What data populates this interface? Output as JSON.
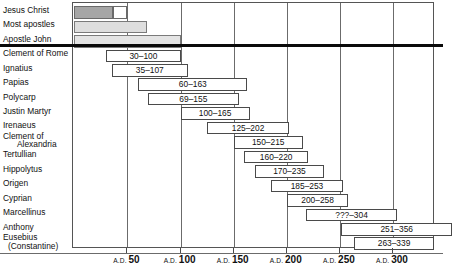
{
  "chart_data": {
    "type": "bar",
    "title": "",
    "subtitle": "",
    "xlabel": "",
    "ylabel": "",
    "orientation": "horizontal",
    "bar_style": "gantt-range",
    "xlim": [
      0,
      340
    ],
    "xticks": [
      50,
      100,
      150,
      200,
      250,
      300
    ],
    "xtick_labels": [
      "A.D. 50",
      "A.D. 100",
      "A.D. 150",
      "A.D. 200",
      "A.D. 250",
      "A.D. 300"
    ],
    "xtick_prefix": "A.D.",
    "grid": true,
    "grid_axis": "x",
    "legend": "none",
    "categories": [
      "Jesus Christ",
      "Most apostles",
      "Apostle John",
      "Clement of Rome",
      "Ignatius",
      "Papias",
      "Polycarp",
      "Justin Martyr",
      "Irenaeus",
      "Clement of Alexandria",
      "Tertullian",
      "Hippolytus",
      "Origen",
      "Cyprian",
      "Marcellinus",
      "Anthony",
      "Eusebius (Constantine)"
    ],
    "series": [
      {
        "name": "Lifespan / ministry range",
        "bars": [
          {
            "category": "Jesus Christ",
            "start": 0,
            "end": 50,
            "label": "",
            "shade": "dark",
            "segments": [
              {
                "start": 0,
                "end": 36
              },
              {
                "start": 36,
                "end": 50
              }
            ]
          },
          {
            "category": "Most apostles",
            "start": 0,
            "end": 68,
            "label": "",
            "shade": "light"
          },
          {
            "category": "Apostle John",
            "start": 0,
            "end": 100,
            "label": "",
            "shade": "lighter"
          },
          {
            "category": "Clement of Rome",
            "start": 30,
            "end": 100,
            "label": "30–100",
            "shade": "none"
          },
          {
            "category": "Ignatius",
            "start": 35,
            "end": 107,
            "label": "35–107",
            "shade": "none"
          },
          {
            "category": "Papias",
            "start": 60,
            "end": 163,
            "label": "60–163",
            "shade": "none"
          },
          {
            "category": "Polycarp",
            "start": 69,
            "end": 155,
            "label": "69–155",
            "shade": "none"
          },
          {
            "category": "Justin Martyr",
            "start": 100,
            "end": 165,
            "label": "100–165",
            "shade": "none"
          },
          {
            "category": "Irenaeus",
            "start": 125,
            "end": 202,
            "label": "125–202",
            "shade": "none"
          },
          {
            "category": "Clement of Alexandria",
            "start": 150,
            "end": 215,
            "label": "150–215",
            "shade": "none"
          },
          {
            "category": "Tertullian",
            "start": 160,
            "end": 220,
            "label": "160–220",
            "shade": "none"
          },
          {
            "category": "Hippolytus",
            "start": 170,
            "end": 235,
            "label": "170–235",
            "shade": "none"
          },
          {
            "category": "Origen",
            "start": 185,
            "end": 253,
            "label": "185–253",
            "shade": "none"
          },
          {
            "category": "Cyprian",
            "start": 200,
            "end": 258,
            "label": "200–258",
            "shade": "none"
          },
          {
            "category": "Marcellinus",
            "start": 218,
            "end": 304,
            "label": "???–304",
            "shade": "none"
          },
          {
            "category": "Anthony",
            "start": 251,
            "end": 356,
            "label": "251–356",
            "shade": "none"
          },
          {
            "category": "Eusebius (Constantine)",
            "start": 263,
            "end": 339,
            "label": "263–339",
            "shade": "none"
          }
        ]
      }
    ],
    "annotations": [
      {
        "type": "thick-rule",
        "after_category": "Apostle John",
        "note": "heavy black divider separating apostolic era from later fathers"
      }
    ]
  },
  "labels": {
    "rows": [
      {
        "line1": "Jesus Christ",
        "line2": ""
      },
      {
        "line1": "Most apostles",
        "line2": ""
      },
      {
        "line1": "Apostle John",
        "line2": ""
      },
      {
        "line1": "Clement of Rome",
        "line2": ""
      },
      {
        "line1": "Ignatius",
        "line2": ""
      },
      {
        "line1": "Papias",
        "line2": ""
      },
      {
        "line1": "Polycarp",
        "line2": ""
      },
      {
        "line1": "Justin Martyr",
        "line2": ""
      },
      {
        "line1": "Irenaeus",
        "line2": ""
      },
      {
        "line1": "Clement of",
        "line2": "Alexandria"
      },
      {
        "line1": "Tertullian",
        "line2": ""
      },
      {
        "line1": "Hippolytus",
        "line2": ""
      },
      {
        "line1": "Origen",
        "line2": ""
      },
      {
        "line1": "Cyprian",
        "line2": ""
      },
      {
        "line1": "Marcellinus",
        "line2": ""
      },
      {
        "line1": "Anthony",
        "line2": ""
      },
      {
        "line1": "Eusebius",
        "line2": "(Constantine)"
      }
    ]
  },
  "colors": {
    "bar_dark": "#a6a6a6",
    "bar_light": "#dedede",
    "bar_lighter": "#e4e4e4",
    "bar_plain": "#ffffff",
    "border": "#4a4a4a",
    "gridline": "#6b6b6b",
    "rule": "#0a0a0a",
    "text": "#111111",
    "background": "#ffffff"
  }
}
